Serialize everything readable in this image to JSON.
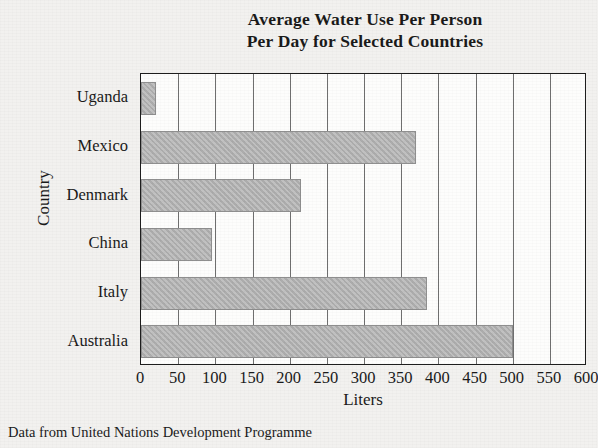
{
  "chart_data": {
    "type": "bar",
    "orientation": "horizontal",
    "title": "Average Water Use Per Person Per Day for Selected Countries",
    "title_lines": [
      "Average Water Use Per Person",
      "Per Day for Selected Countries"
    ],
    "categories": [
      "Uganda",
      "Mexico",
      "Denmark",
      "China",
      "Italy",
      "Australia"
    ],
    "values": [
      20,
      370,
      215,
      95,
      385,
      500
    ],
    "xlabel": "Liters",
    "ylabel": "Country",
    "xlim": [
      0,
      600
    ],
    "xticks": [
      0,
      50,
      100,
      150,
      200,
      250,
      300,
      350,
      400,
      450,
      500,
      550,
      600
    ],
    "xtick_labels": [
      "0",
      "50",
      "100",
      "150",
      "200",
      "250",
      "300",
      "350",
      "400",
      "450",
      "500",
      "550",
      "600"
    ],
    "grid": "vertical",
    "legend": "none",
    "bar_color": "#b2b2b2",
    "bar_edge_color": "#8f8f8f",
    "axis_color": "#1d1d1d",
    "plot_background": "#fdfdfc",
    "page_background": "#f2f1ef"
  },
  "source_note": "Data from United Nations Development Programme"
}
